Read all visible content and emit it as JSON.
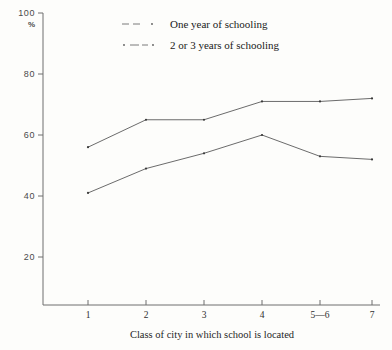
{
  "chart_data": {
    "type": "line",
    "title": "",
    "xlabel": "Class of city in which school is located",
    "ylabel": "%",
    "categories": [
      "1",
      "2",
      "3",
      "4",
      "5—6",
      "7"
    ],
    "ylim": [
      0,
      100
    ],
    "yticks": [
      "20",
      "40",
      "60",
      "80",
      "100"
    ],
    "grid": false,
    "legend_position": "top-center",
    "series": [
      {
        "name": "One year of schooling",
        "values": [
          56,
          65,
          65,
          71,
          71,
          72
        ]
      },
      {
        "name": "2 or 3 years of schooling",
        "values": [
          41,
          49,
          54,
          60,
          53,
          52
        ]
      }
    ]
  },
  "axes": {
    "y_unit_label": "%",
    "y_top_label": "100",
    "x_axis_title": "Class of city in which school is located"
  },
  "legend": {
    "entries": [
      {
        "label": "One year of schooling"
      },
      {
        "label": "2 or 3 years of schooling"
      }
    ]
  }
}
